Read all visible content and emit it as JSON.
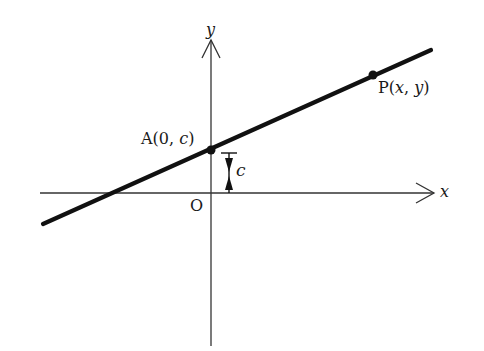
{
  "diagram": {
    "type": "coordinate-geometry",
    "axes": {
      "x_label": "x",
      "y_label": "y",
      "origin_label": "O"
    },
    "points": [
      {
        "id": "A",
        "label": "A(0, c)",
        "name": "A",
        "coords_text": "(0, c)"
      },
      {
        "id": "P",
        "label": "P(x, y)",
        "name": "P",
        "coords_text": "(x, y)"
      }
    ],
    "intercept_marker": {
      "label": "c"
    },
    "colors": {
      "line": "#111111",
      "axis": "#333333",
      "background": "#ffffff"
    }
  },
  "labels": {
    "y_axis": "y",
    "x_axis": "x",
    "origin": "O",
    "point_a": "A(0, c)",
    "point_p": "P(x, y)",
    "intercept": "c"
  }
}
